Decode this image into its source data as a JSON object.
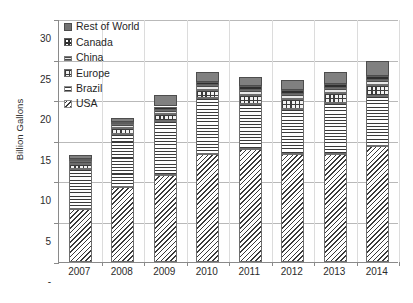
{
  "chart_data": {
    "type": "bar",
    "stacked": true,
    "title": "",
    "xlabel": "",
    "ylabel": "Billion Gallons",
    "categories": [
      "2007",
      "2008",
      "2009",
      "2010",
      "2011",
      "2012",
      "2013",
      "2014"
    ],
    "ylim": [
      0,
      30
    ],
    "yticks": [
      "-",
      "5",
      "10",
      "15",
      "20",
      "25",
      "30"
    ],
    "ytick_values": [
      0,
      5,
      10,
      15,
      20,
      25,
      30
    ],
    "grid": true,
    "legend_position": "upper-left-inside",
    "series": [
      {
        "name": "USA",
        "values": [
          6.5,
          9.3,
          10.8,
          13.3,
          13.9,
          13.3,
          13.3,
          14.3
        ]
      },
      {
        "name": "Brazil",
        "values": [
          5.0,
          6.5,
          6.6,
          6.9,
          5.6,
          5.6,
          6.3,
          6.2
        ]
      },
      {
        "name": "Europe",
        "values": [
          0.6,
          0.7,
          0.9,
          1.0,
          1.1,
          1.2,
          1.3,
          1.4
        ]
      },
      {
        "name": "China",
        "values": [
          0.4,
          0.5,
          0.5,
          0.6,
          0.6,
          0.6,
          0.6,
          0.6
        ]
      },
      {
        "name": "Canada",
        "values": [
          0.2,
          0.3,
          0.4,
          0.4,
          0.5,
          0.5,
          0.5,
          0.5
        ]
      },
      {
        "name": "Rest of World",
        "values": [
          0.5,
          0.5,
          1.4,
          1.3,
          1.2,
          1.3,
          1.5,
          1.8
        ]
      }
    ],
    "totals": [
      13.2,
      17.8,
      20.6,
      23.5,
      22.9,
      22.5,
      23.5,
      24.8
    ]
  },
  "legend": {
    "items": [
      {
        "label": "Rest of World",
        "swatch": "row-swatch-icon"
      },
      {
        "label": "Canada",
        "swatch": "canada-swatch-icon"
      },
      {
        "label": "China",
        "swatch": "china-swatch-icon"
      },
      {
        "label": "Europe",
        "swatch": "europe-swatch-icon"
      },
      {
        "label": "Brazil",
        "swatch": "brazil-swatch-icon"
      },
      {
        "label": "USA",
        "swatch": "usa-swatch-icon"
      }
    ]
  },
  "colors": {
    "rest_of_world": "#808080",
    "canada": "#2f2f2f",
    "china": "#4a4a4a",
    "europe": "#3b3b3b",
    "brazil": "#3a3a3a",
    "usa": "#3a3a3a",
    "axis": "#8a8a8a",
    "gridline": "#b9b9b9"
  }
}
